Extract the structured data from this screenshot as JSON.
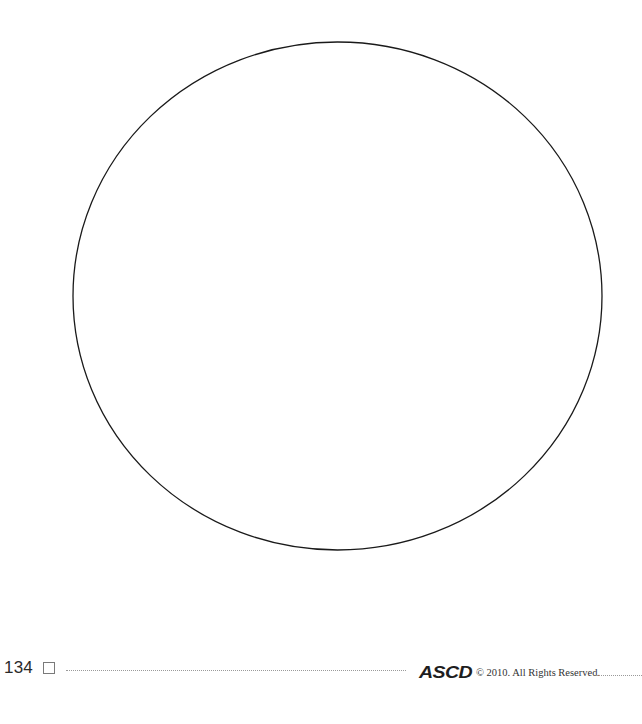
{
  "figure": {
    "shape": "circle",
    "stroke_color": "#1a1a1a",
    "center_x": 337.5,
    "center_y": 296,
    "radius_x": 264.5,
    "radius_y": 254
  },
  "footer": {
    "page_number": "134",
    "logo_text": "ASCD",
    "copyright": "© 2010. All Rights Reserved."
  }
}
